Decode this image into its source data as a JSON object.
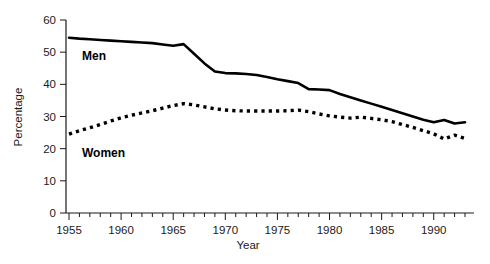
{
  "chart_data": {
    "type": "line",
    "title": "",
    "xlabel": "Year",
    "ylabel": "Percentage",
    "xlim": [
      1955,
      1993
    ],
    "ylim": [
      0,
      60
    ],
    "ytick_values": [
      0,
      10,
      20,
      30,
      40,
      50,
      60
    ],
    "ytick_labels": [
      "0",
      "10",
      "20",
      "30",
      "40",
      "50",
      "60"
    ],
    "xtick_labels": [
      "1955",
      "1960",
      "1965",
      "1970",
      "1975",
      "1980",
      "1985",
      "1990"
    ],
    "xtick_values": [
      1955,
      1960,
      1965,
      1970,
      1975,
      1980,
      1985,
      1990
    ],
    "minor_xticks_every": 1,
    "grid": false,
    "legend_position": "inline-annotations",
    "x": [
      1955,
      1956,
      1957,
      1958,
      1959,
      1960,
      1961,
      1962,
      1963,
      1964,
      1965,
      1966,
      1967,
      1968,
      1969,
      1970,
      1971,
      1972,
      1973,
      1974,
      1975,
      1976,
      1977,
      1978,
      1979,
      1980,
      1981,
      1982,
      1983,
      1984,
      1985,
      1986,
      1987,
      1988,
      1989,
      1990,
      1991,
      1992,
      1993
    ],
    "series": [
      {
        "name": "Men",
        "style": "solid",
        "color": "#000000",
        "label_text": "Men",
        "values": [
          54.5,
          54.2,
          54.0,
          53.8,
          53.6,
          53.4,
          53.2,
          53.0,
          52.8,
          52.4,
          52.0,
          52.5,
          49.5,
          46.5,
          44.0,
          43.5,
          43.4,
          43.2,
          42.9,
          42.3,
          41.6,
          41.0,
          40.4,
          38.5,
          38.4,
          38.2,
          37.0,
          36.0,
          35.0,
          34.0,
          33.0,
          32.0,
          31.0,
          30.0,
          29.0,
          28.2,
          28.9,
          27.8,
          28.2
        ]
      },
      {
        "name": "Women",
        "style": "dotted",
        "color": "#000000",
        "label_text": "Women",
        "values": [
          24.5,
          25.6,
          26.5,
          27.5,
          28.6,
          29.6,
          30.4,
          31.1,
          31.8,
          32.6,
          33.4,
          34.0,
          33.6,
          33.0,
          32.4,
          32.0,
          31.8,
          31.7,
          31.7,
          31.7,
          31.7,
          31.8,
          32.0,
          31.5,
          30.8,
          30.2,
          29.8,
          29.5,
          29.8,
          29.4,
          29.0,
          28.4,
          27.5,
          26.6,
          25.6,
          24.6,
          23.0,
          24.2,
          23.2
        ]
      }
    ]
  },
  "annotations": {
    "men_label": "Men",
    "women_label": "Women"
  },
  "axes": {
    "y_title": "Percentage",
    "x_title": "Year"
  }
}
